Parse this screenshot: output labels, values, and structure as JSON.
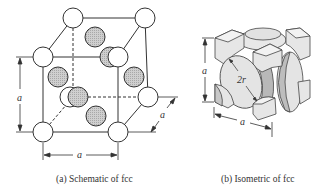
{
  "figure": {
    "panels": [
      {
        "id": "a",
        "caption": "(a) Schematic of fcc",
        "dimension_labels": {
          "vertical": "a",
          "horizontal": "a",
          "depth": "a"
        }
      },
      {
        "id": "b",
        "caption": "(b) Isometric of fcc",
        "dimension_labels": {
          "vertical": "a",
          "horizontal": "a",
          "diagonal": "2r"
        }
      }
    ],
    "colors": {
      "line": "#333333",
      "corner_atom_fill": "#ffffff",
      "face_atom_fill": "#c8c8c8",
      "solid_fill": "#e6e6e6",
      "solid_shade": "#bdbdbd"
    }
  }
}
